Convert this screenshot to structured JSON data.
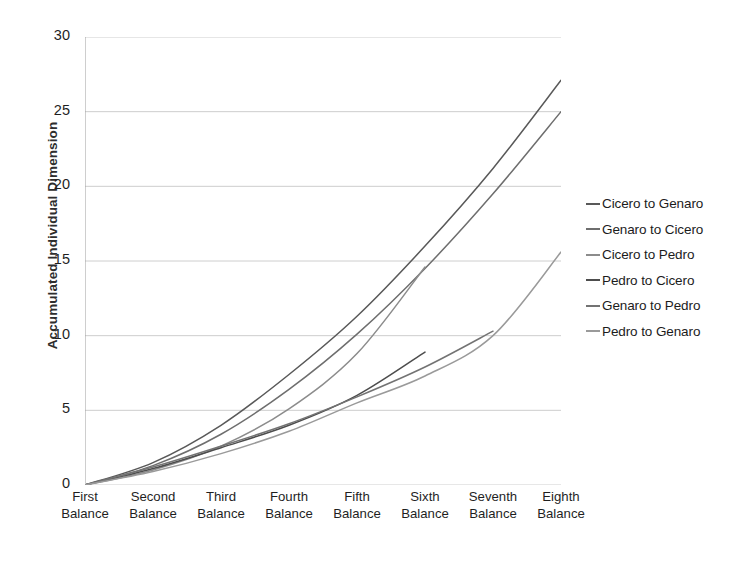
{
  "chart_data": {
    "type": "line",
    "title": "",
    "xlabel": "",
    "ylabel": "Accumulated Individual Dimension",
    "categories": [
      "First Balance",
      "Second Balance",
      "Third Balance",
      "Fourth Balance",
      "Fifth Balance",
      "Sixth Balance",
      "Seventh Balance",
      "Eighth Balance"
    ],
    "category_lines": [
      [
        "First",
        "Balance"
      ],
      [
        "Second",
        "Balance"
      ],
      [
        "Third",
        "Balance"
      ],
      [
        "Fourth",
        "Balance"
      ],
      [
        "Fifth",
        "Balance"
      ],
      [
        "Sixth",
        "Balance"
      ],
      [
        "Seventh",
        "Balance"
      ],
      [
        "Eighth",
        "Balance"
      ]
    ],
    "ylim": [
      0,
      30
    ],
    "yticks": [
      0,
      5,
      10,
      15,
      20,
      25,
      30
    ],
    "xlim_categories": 8,
    "grid": "horizontal",
    "legend_position": "right",
    "series": [
      {
        "name": "Cicero to Genaro",
        "color": "#595959",
        "values": [
          0,
          1.5,
          4.0,
          7.4,
          11.3,
          16.0,
          21.2,
          27.1
        ]
      },
      {
        "name": "Genaro to Cicero",
        "color": "#6e6e6e",
        "values": [
          0,
          1.3,
          3.4,
          6.4,
          10.1,
          14.5,
          19.5,
          25.0
        ]
      },
      {
        "name": "Cicero to Pedro",
        "color": "#8c8c8c",
        "values": [
          0,
          1.0,
          2.6,
          5.1,
          8.8,
          14.6,
          null,
          null
        ]
      },
      {
        "name": "Pedro to Cicero",
        "color": "#4d4d4d",
        "values": [
          0,
          1.1,
          2.5,
          4.0,
          6.0,
          8.9,
          null,
          null
        ]
      },
      {
        "name": "Genaro to Pedro",
        "color": "#737373",
        "values": [
          0,
          1.2,
          2.6,
          4.1,
          5.9,
          7.9,
          10.3,
          null
        ]
      },
      {
        "name": "Pedro to Genaro",
        "color": "#9a9a9a",
        "values": [
          0,
          0.9,
          2.1,
          3.6,
          5.5,
          7.3,
          10.0,
          15.6
        ]
      }
    ]
  },
  "legend": {
    "items": [
      {
        "label": "Cicero to Genaro",
        "color": "#595959"
      },
      {
        "label": "Genaro to Cicero",
        "color": "#6e6e6e"
      },
      {
        "label": "Cicero to Pedro",
        "color": "#8c8c8c"
      },
      {
        "label": "Pedro to Cicero",
        "color": "#4d4d4d"
      },
      {
        "label": "Genaro to Pedro",
        "color": "#737373"
      },
      {
        "label": "Pedro to Genaro",
        "color": "#9a9a9a"
      }
    ]
  },
  "axes": {
    "y_title": "Accumulated Individual Dimension",
    "y_tick_labels": [
      "30",
      "25",
      "20",
      "15",
      "10",
      "5",
      "0"
    ]
  },
  "colors": {
    "grid": "#c8c8c8",
    "axis": "#9e9e9e",
    "text": "#1f1f1f"
  }
}
